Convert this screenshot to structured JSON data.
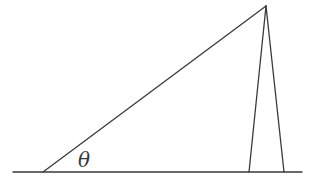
{
  "diagram": {
    "type": "geometry",
    "stroke_color": "#3a3a3a",
    "background": "#ffffff",
    "baseline": {
      "x1": 13,
      "y1": 172,
      "x2": 302,
      "y2": 172
    },
    "apex": {
      "x": 266,
      "y": 6
    },
    "left_vertex": {
      "x": 43,
      "y": 172
    },
    "inner_foot": {
      "x": 249,
      "y": 172
    },
    "outer_foot": {
      "x": 284,
      "y": 172
    },
    "labels": {
      "angle": "θ"
    },
    "angle_label_position": {
      "x": 78,
      "y": 150
    }
  }
}
